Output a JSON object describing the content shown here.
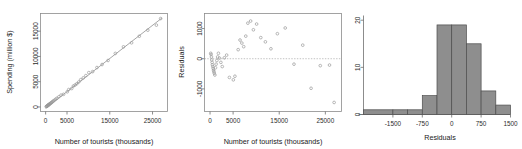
{
  "figure": {
    "background": "#ffffff",
    "point_color": "#9a9a9a",
    "line_color": "#8f8f8f",
    "bar_fill": "#8e8e8e",
    "bar_stroke": "#4d4d4d",
    "panel_count": 3
  },
  "chart_data": [
    {
      "type": "scatter",
      "id": "tourists-vs-spending",
      "title": "",
      "xlabel": "Number of tourists (thousands)",
      "ylabel": "Spending (million $)",
      "xlim": [
        -1200,
        28500
      ],
      "ylim": [
        -900,
        18500
      ],
      "xticks": [
        0,
        5000,
        15000,
        25000
      ],
      "xticklabels": [
        "0",
        "5000",
        "15000",
        "25000"
      ],
      "yticks": [
        0,
        5000,
        10000,
        15000
      ],
      "yticklabels": [
        "0",
        "5000",
        "10000",
        "15000"
      ],
      "grid": false,
      "legend": null,
      "has_fit_line": true,
      "fit_line": {
        "x0": 0,
        "y0": -250,
        "x1": 27200,
        "y1": 17600
      },
      "x": [
        150,
        230,
        310,
        380,
        450,
        520,
        600,
        680,
        760,
        840,
        920,
        1050,
        1180,
        1320,
        1480,
        1650,
        1820,
        2050,
        2350,
        2650,
        3100,
        3600,
        4200,
        5050,
        5400,
        6100,
        6500,
        6900,
        7300,
        7750,
        8200,
        8800,
        9400,
        10100,
        11000,
        12000,
        13200,
        14600,
        16300,
        18200,
        20100,
        21900,
        23900,
        25900,
        26900
      ],
      "y": [
        60,
        110,
        150,
        200,
        250,
        300,
        350,
        400,
        460,
        520,
        580,
        660,
        740,
        830,
        940,
        1060,
        1180,
        1330,
        1530,
        1720,
        2010,
        2340,
        2500,
        3000,
        3450,
        3650,
        4150,
        4350,
        4600,
        4950,
        5400,
        5750,
        6200,
        6800,
        7000,
        7800,
        8400,
        9200,
        10600,
        11900,
        12700,
        14000,
        15200,
        16200,
        17500
      ]
    },
    {
      "type": "scatter",
      "id": "residuals-vs-tourists",
      "title": "",
      "xlabel": "Number of tourists (thousands)",
      "ylabel": "Residuals",
      "xlim": [
        -1200,
        28500
      ],
      "ylim": [
        -1750,
        1500
      ],
      "xticks": [
        0,
        5000,
        15000,
        25000
      ],
      "xticklabels": [
        "0",
        "5000",
        "15000",
        "25000"
      ],
      "yticks": [
        -1000,
        0,
        1000
      ],
      "yticklabels": [
        "-1000",
        "0",
        "1000"
      ],
      "grid": false,
      "legend": null,
      "has_zero_line": true,
      "zero_line_y": 0,
      "x": [
        150,
        230,
        310,
        380,
        450,
        520,
        600,
        680,
        760,
        840,
        920,
        1050,
        1180,
        1320,
        1480,
        1650,
        1820,
        2050,
        2350,
        2650,
        3100,
        3600,
        4200,
        5050,
        5400,
        6100,
        6500,
        6900,
        7300,
        7750,
        8200,
        8800,
        9400,
        10100,
        11000,
        12000,
        13200,
        14600,
        16300,
        18200,
        20100,
        21900,
        23900,
        25900,
        26900
      ],
      "y": [
        180,
        140,
        60,
        -40,
        -120,
        -200,
        -260,
        -320,
        -380,
        -430,
        -480,
        -540,
        -300,
        -180,
        -60,
        60,
        180,
        20,
        -120,
        -260,
        30,
        120,
        -620,
        -700,
        -580,
        300,
        620,
        520,
        400,
        750,
        1180,
        1250,
        960,
        1150,
        700,
        560,
        330,
        830,
        1020,
        -180,
        450,
        -980,
        -230,
        -210,
        -1450
      ]
    },
    {
      "type": "bar",
      "subtype": "histogram",
      "id": "residuals-histogram",
      "title": "",
      "xlabel": "Residuals",
      "ylabel": "",
      "xlim": [
        -2250,
        1500
      ],
      "ylim": [
        0,
        21
      ],
      "xticks": [
        -1500,
        -750,
        0,
        750,
        1500
      ],
      "xticklabels": [
        "-1500",
        "-750",
        "0",
        "750",
        "1500"
      ],
      "yticks": [
        0,
        10,
        20
      ],
      "yticklabels": [
        "0",
        "10",
        "20"
      ],
      "grid": false,
      "legend": null,
      "bin_width": 375,
      "bin_edges": [
        -2250,
        -1875,
        -1500,
        -1125,
        -750,
        -375,
        0,
        375,
        750,
        1125,
        1500
      ],
      "categories": [
        "-2250 to -1875",
        "-1875 to -1500",
        "-1500 to -1125",
        "-1125 to -750",
        "-750 to -375",
        "-375 to 0",
        "0 to 375",
        "375 to 750",
        "750 to 1125",
        "1125 to 1500"
      ],
      "values": [
        1,
        1,
        1,
        1,
        4,
        19,
        19,
        15,
        5,
        2
      ],
      "bars": [
        {
          "x0": -2250,
          "x1": -1500,
          "height": 1
        },
        {
          "x0": -1500,
          "x1": -1125,
          "height": 1
        },
        {
          "x0": -1125,
          "x1": -750,
          "height": 1
        },
        {
          "x0": -750,
          "x1": -375,
          "height": 4
        },
        {
          "x0": -375,
          "x1": 0,
          "height": 19
        },
        {
          "x0": 0,
          "x1": 375,
          "height": 19
        },
        {
          "x0": 375,
          "x1": 750,
          "height": 15
        },
        {
          "x0": 750,
          "x1": 1125,
          "height": 5
        },
        {
          "x0": 1125,
          "x1": 1500,
          "height": 2
        }
      ]
    }
  ]
}
